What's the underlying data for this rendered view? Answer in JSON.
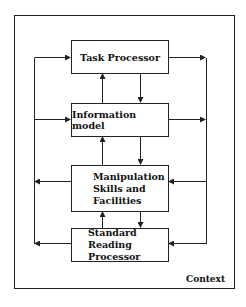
{
  "diagram": {
    "boxes": [
      {
        "id": "task-processor",
        "label": "Task Processor"
      },
      {
        "id": "information-model",
        "label": "Information model"
      },
      {
        "id": "manipulation-skills",
        "lines": [
          "Manipulation",
          "Skills and",
          "Facilities"
        ]
      },
      {
        "id": "standard-reading-processor",
        "lines": [
          "Standard Reading",
          "Processor"
        ]
      }
    ],
    "container_label": "Context",
    "colors": {
      "line": "#222222",
      "background": "#ffffff"
    }
  }
}
